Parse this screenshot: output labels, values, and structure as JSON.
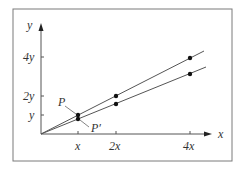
{
  "diagram": {
    "axes": {
      "x_label": "x",
      "y_label": "y",
      "x_ticks": [
        "x",
        "2x",
        "4x"
      ],
      "y_ticks": [
        "y",
        "2y",
        "4y"
      ]
    },
    "points": {
      "p_label": "P",
      "p_prime_label": "P′"
    },
    "colors": {
      "line": "#555555",
      "point": "#111111",
      "frame": "#777777"
    }
  }
}
